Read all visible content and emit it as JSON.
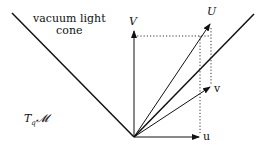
{
  "diagram": {
    "cone_label_line1": "vacuum light",
    "cone_label_line2": "cone",
    "manifold_label": "T",
    "manifold_sub": "q",
    "manifold_script": "𝓜",
    "vectors": {
      "V": "V",
      "U": "U",
      "u": "u",
      "v": "v"
    },
    "colors": {
      "ink": "#111111",
      "background": "#ffffff"
    }
  }
}
